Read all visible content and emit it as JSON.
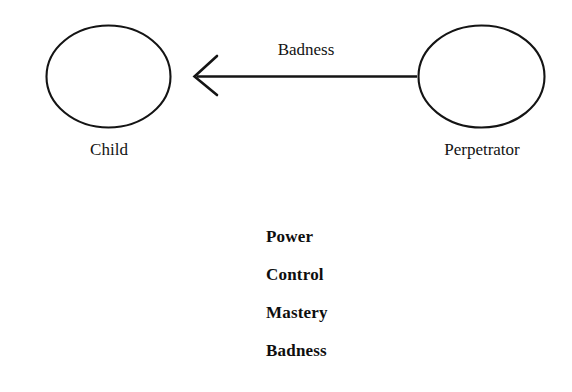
{
  "diagram": {
    "type": "concept-diagram",
    "background_color": "#ffffff",
    "stroke_color": "#141414",
    "text_color": "#131313",
    "nodes": [
      {
        "id": "child",
        "label": "Child",
        "shape": "ellipse",
        "center_x": 108,
        "center_y": 76,
        "radius_x": 62,
        "radius_y": 51
      },
      {
        "id": "perpetrator",
        "label": "Perpetrator",
        "shape": "ellipse",
        "center_x": 481,
        "center_y": 76,
        "radius_x": 63,
        "radius_y": 51
      }
    ],
    "edges": [
      {
        "id": "badness-edge",
        "label": "Badness",
        "from": "perpetrator",
        "to": "child",
        "direction": "left",
        "arrowhead": "open-v"
      }
    ],
    "attribute_list": {
      "items": [
        "Power",
        "Control",
        "Mastery",
        "Badness"
      ]
    }
  }
}
